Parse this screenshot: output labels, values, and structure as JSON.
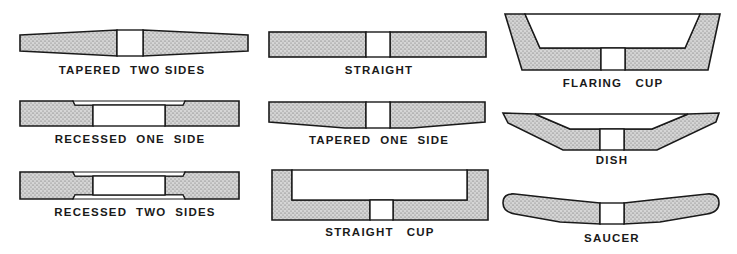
{
  "figure": {
    "colors": {
      "fill": "#cfcfcf",
      "stroke": "#1a1a1a",
      "hole": "#ffffff",
      "text": "#1a1a1a"
    }
  },
  "shapes": [
    {
      "id": "tapered-two-sides",
      "label": "TAPERED  TWO SIDES",
      "column": 1,
      "row": 1
    },
    {
      "id": "recessed-one-side",
      "label": "RECESSED  ONE  SIDE",
      "column": 1,
      "row": 2
    },
    {
      "id": "recessed-two-sides",
      "label": "RECESSED  TWO  SIDES",
      "column": 1,
      "row": 3
    },
    {
      "id": "straight",
      "label": "STRAIGHT",
      "column": 2,
      "row": 1
    },
    {
      "id": "tapered-one-side",
      "label": "TAPERED  ONE  SIDE",
      "column": 2,
      "row": 2
    },
    {
      "id": "straight-cup",
      "label": "STRAIGHT   CUP",
      "column": 2,
      "row": 3
    },
    {
      "id": "flaring-cup",
      "label": "FLARING   CUP",
      "column": 3,
      "row": 1
    },
    {
      "id": "dish",
      "label": "DISH",
      "column": 3,
      "row": 2
    },
    {
      "id": "saucer",
      "label": "SAUCER",
      "column": 3,
      "row": 3
    }
  ]
}
